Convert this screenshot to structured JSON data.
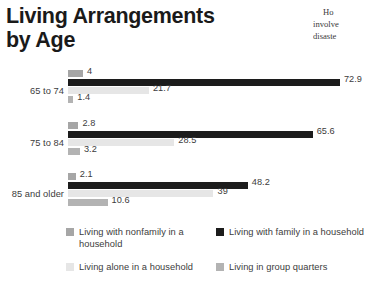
{
  "title": {
    "line1": "Living Arrangements",
    "line2": "by Age"
  },
  "side_column": {
    "line1": "Ho",
    "line2": "involve",
    "line3": "disaste"
  },
  "chart_data": {
    "type": "bar",
    "orientation": "horizontal",
    "title": "Living Arrangements by Age",
    "xlabel": "",
    "ylabel": "",
    "xlim": [
      0,
      80
    ],
    "grid": false,
    "legend_position": "bottom",
    "categories": [
      "65 to 74",
      "75 to 84",
      "85 and older"
    ],
    "series": [
      {
        "name": "Living with nonfamily in a household",
        "color": "#a6a6a6",
        "values": [
          4,
          2.8,
          2.1
        ],
        "labels": [
          "4",
          "2.8",
          "2.1"
        ]
      },
      {
        "name": "Living with family in a household",
        "color": "#1c1c1c",
        "values": [
          72.9,
          65.6,
          48.2
        ],
        "labels": [
          "72.9",
          "65.6",
          "48.2"
        ]
      },
      {
        "name": "Living alone in a household",
        "color": "#e6e6e6",
        "values": [
          21.7,
          28.5,
          39
        ],
        "labels": [
          "21.7",
          "28.5",
          "39"
        ]
      },
      {
        "name": "Living in group quarters",
        "color": "#b3b3b3",
        "values": [
          1.4,
          3.2,
          10.6
        ],
        "labels": [
          "1.4",
          "3.2",
          "10.6"
        ]
      }
    ]
  },
  "legend": {
    "items": [
      {
        "label": "Living with nonfamily in a household",
        "color": "#a6a6a6"
      },
      {
        "label": "Living with family in a household",
        "color": "#1c1c1c"
      },
      {
        "label": "Living alone in a household",
        "color": "#e6e6e6"
      },
      {
        "label": "Living in group quarters",
        "color": "#b3b3b3"
      }
    ]
  }
}
